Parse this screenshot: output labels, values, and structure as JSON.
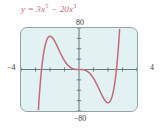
{
  "figure": {
    "equation_html": "y = 3x<sup>5</sup> &minus; 20x<sup>3</sup>",
    "equation_text": "y = 3x^5 - 20x^3",
    "labels": {
      "ymax": "80",
      "ymin": "−80",
      "xmin": "−4",
      "xmax": "4"
    },
    "colors": {
      "curve": "#c4697a",
      "screen_background": "#e2f2f2",
      "screen_border": "#9aa3a3",
      "axis": "#5a6a6a",
      "label_text": "#3d3d3d",
      "equation_text": "#c4697a"
    }
  },
  "chart_data": {
    "type": "line",
    "xlabel": "",
    "ylabel": "",
    "xlim": [
      -4,
      4
    ],
    "ylim": [
      -80,
      80
    ],
    "grid": false,
    "legend": null,
    "xticks": [
      -4,
      -3,
      -2,
      -1,
      0,
      1,
      2,
      3,
      4
    ],
    "yticks": [
      -80,
      -60,
      -40,
      -20,
      0,
      20,
      40,
      60,
      80
    ],
    "xtick_labels": [
      "−4",
      "",
      "",
      "",
      "",
      "",
      "",
      "",
      "4"
    ],
    "ytick_labels": [
      "−80",
      "",
      "",
      "",
      "",
      "",
      "",
      "",
      "80"
    ],
    "series": [
      {
        "name": "y = 3x^5 - 20x^3",
        "color": "#c4697a",
        "x": [
          -2.4,
          -2.3,
          -2.2,
          -2.1,
          -2.0,
          -1.9,
          -1.8,
          -1.7,
          -1.6,
          -1.5,
          -1.4,
          -1.3,
          -1.2,
          -1.1,
          -1.0,
          -0.9,
          -0.8,
          -0.7,
          -0.6,
          -0.5,
          -0.4,
          -0.3,
          -0.2,
          -0.1,
          0.0,
          0.1,
          0.2,
          0.3,
          0.4,
          0.5,
          0.6,
          0.7,
          0.8,
          0.9,
          1.0,
          1.1,
          1.2,
          1.3,
          1.4,
          1.5,
          1.6,
          1.7,
          1.8,
          1.9,
          2.0,
          2.1,
          2.2,
          2.3,
          2.4
        ],
        "y": [
          -38.1,
          46.8,
          107.4,
          149.5,
          64.0,
          62.9,
          59.8,
          55.1,
          49.4,
          43.1,
          36.6,
          30.3,
          24.1,
          18.2,
          17.0,
          12.8,
          9.4,
          6.6,
          4.4,
          2.4,
          1.3,
          0.5,
          0.2,
          0.02,
          0.0,
          -0.02,
          -0.2,
          -0.5,
          -1.3,
          -2.4,
          -4.4,
          -6.6,
          -9.4,
          -12.8,
          -17.0,
          -18.2,
          -24.1,
          -30.3,
          -36.6,
          -43.1,
          -49.4,
          -55.1,
          -59.8,
          -62.9,
          -64.0,
          -59.5,
          -47.4,
          -25.0,
          38.1
        ]
      }
    ],
    "annotations": [
      {
        "text": "80",
        "position": "above-plot-center"
      },
      {
        "text": "−80",
        "position": "below-plot-center"
      },
      {
        "text": "−4",
        "position": "left-of-plot"
      },
      {
        "text": "4",
        "position": "right-of-plot"
      }
    ]
  }
}
